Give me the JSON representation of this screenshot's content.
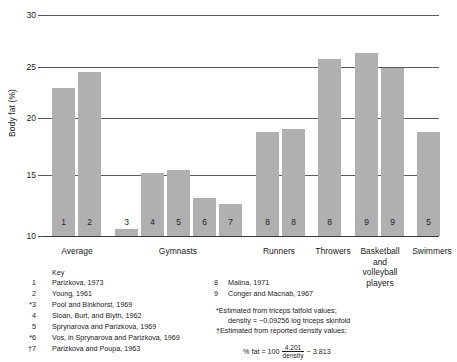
{
  "chart_data": {
    "type": "bar",
    "title": "",
    "xlabel": "",
    "ylabel": "Body fat (%)",
    "ylim": [
      10,
      30
    ],
    "yticks": [
      10,
      15,
      20,
      25,
      30
    ],
    "ytick_labels": [
      "10",
      "15",
      "20",
      "25",
      "30"
    ],
    "grid": true,
    "legend": "none",
    "categories": [
      "Average",
      "Gymnasts",
      "Runners",
      "Throwers",
      "Basketball and volleyball players",
      "Swimmers"
    ],
    "bars": [
      {
        "label": "1",
        "value": 23.4,
        "group": "Average"
      },
      {
        "label": "2",
        "value": 24.8,
        "group": "Average"
      },
      {
        "label": "3",
        "value": 10.6,
        "group": "Gymnasts"
      },
      {
        "label": "4",
        "value": 15.7,
        "group": "Gymnasts"
      },
      {
        "label": "5",
        "value": 16.0,
        "group": "Gymnasts"
      },
      {
        "label": "6",
        "value": 13.4,
        "group": "Gymnasts"
      },
      {
        "label": "7",
        "value": 12.9,
        "group": "Gymnasts"
      },
      {
        "label": "8",
        "value": 19.4,
        "group": "Runners"
      },
      {
        "label": "8",
        "value": 19.7,
        "group": "Runners"
      },
      {
        "label": "8",
        "value": 26.0,
        "group": "Throwers"
      },
      {
        "label": "9",
        "value": 26.6,
        "group": "Basketball and volleyball players"
      },
      {
        "label": "9",
        "value": 25.2,
        "group": "Basketball and volleyball players"
      },
      {
        "label": "5",
        "value": 19.4,
        "group": "Swimmers"
      }
    ],
    "bar_color": "#b0b0b0"
  },
  "axis": {
    "ylabel": "Body fat (%)",
    "ticks": [
      "30",
      "25",
      "20",
      "15",
      "10"
    ]
  },
  "categories": [
    {
      "name": "Average"
    },
    {
      "name": "Gymnasts"
    },
    {
      "name": "Runners"
    },
    {
      "name": "Throwers"
    },
    {
      "name": "Basketball\nand\nvolleyball\nplayers"
    },
    {
      "name": "Swimmers"
    }
  ],
  "key": {
    "title": "Key",
    "left_entries": [
      {
        "marker": "1",
        "text": "Parizkova, 1973"
      },
      {
        "marker": "2",
        "text": "Young, 1961"
      },
      {
        "marker": "*3",
        "text": "Pool and Binkhorst, 1969"
      },
      {
        "marker": "4",
        "text": "Sloan, Burt, and Blyth, 1962"
      },
      {
        "marker": "5",
        "text": "Sprynarova and Parizkova, 1969"
      },
      {
        "marker": "*6",
        "text": "Vos, in Sprynarova and Parizkova, 1969"
      },
      {
        "marker": "†7",
        "text": "Parizkova and Poupa, 1963"
      }
    ],
    "right_entries": [
      {
        "marker": "8",
        "text": "Malina, 1971"
      },
      {
        "marker": "9",
        "text": "Conger and Macnab, 1967"
      }
    ]
  },
  "footnotes": {
    "line1": "*Estimated from triceps fatfold values;",
    "line2": "density = −0.09256 log triceps skinfold",
    "line3": "†Estimated from reported density values;",
    "formula_prefix": "% fat = 100",
    "formula_numerator": "4.201",
    "formula_denominator": "density",
    "formula_suffix": "− 3.813"
  }
}
